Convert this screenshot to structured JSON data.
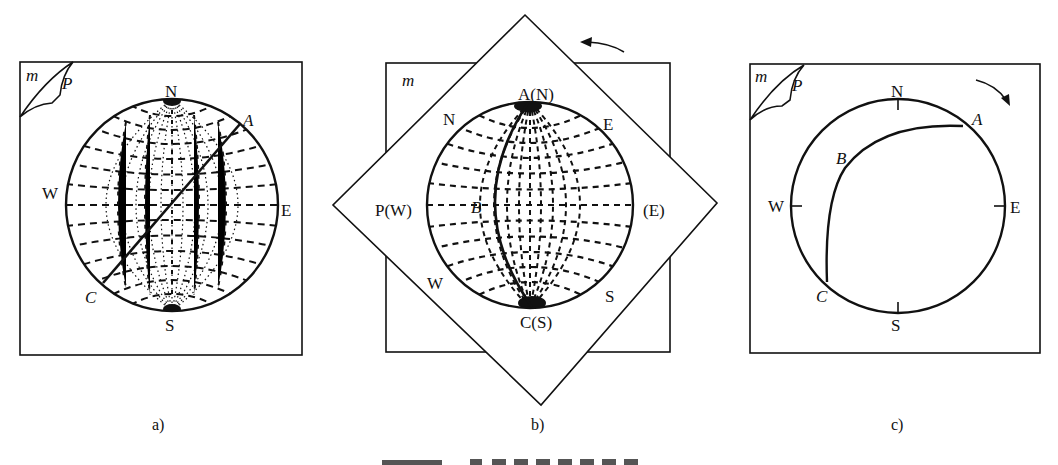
{
  "figure": {
    "panels": [
      {
        "id": "a",
        "sublabel": "a)",
        "corner_label_m": "m",
        "corner_label_p": "P",
        "compass": {
          "N": "N",
          "S": "S",
          "W": "W",
          "E": "E"
        },
        "points": {
          "A": "A",
          "C": "C"
        },
        "description": "Stereonet (Wulff net) under tracing paper; great circle line from C to A through center"
      },
      {
        "id": "b",
        "sublabel": "b)",
        "corner_label_m": "m",
        "compass_rotated": {
          "N": "N",
          "E": "E",
          "S": "S",
          "W": "W"
        },
        "points": {
          "A_N": "A(N)",
          "C_S": "C(S)",
          "P_W": "P(W)",
          "E_paren": "(E)",
          "B": "B"
        },
        "arrow": "counterclockwise",
        "description": "Tracing paper rotated 45° so A aligns with N; great circle through A, B, C drawn on net"
      },
      {
        "id": "c",
        "sublabel": "c)",
        "corner_label_m": "m",
        "corner_label_p": "P",
        "compass": {
          "N": "N",
          "S": "S",
          "W": "W",
          "E": "E"
        },
        "points": {
          "A": "A",
          "B": "B",
          "C": "C"
        },
        "arrow": "clockwise",
        "description": "Tracing paper rotated back; primitive circle with great-circle arc A–B–C"
      }
    ],
    "caption_partial": "(caption truncated at image bottom edge)"
  },
  "colors": {
    "ink": "#111111",
    "background": "#ffffff"
  }
}
